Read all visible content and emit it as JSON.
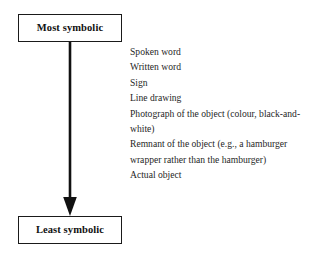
{
  "diagram": {
    "type": "flow-arrow-with-list",
    "colors": {
      "background": "#ffffff",
      "border": "#1a1a1a",
      "text": "#1f1f1f",
      "arrow": "#111111"
    },
    "top_node": {
      "label": "Most symbolic"
    },
    "bottom_node": {
      "label": "Least symbolic"
    },
    "arrow": {
      "direction": "down",
      "head": "solid-triangle"
    },
    "items": [
      {
        "text": "Spoken word"
      },
      {
        "text": "Written word"
      },
      {
        "text": "Sign"
      },
      {
        "text": "Line drawing"
      },
      {
        "text": "Photograph of the object (colour, black-and-white)"
      },
      {
        "text": "Remnant of the object (e.g., a hamburger wrapper rather than the hamburger)"
      },
      {
        "text": "Actual object"
      }
    ]
  }
}
